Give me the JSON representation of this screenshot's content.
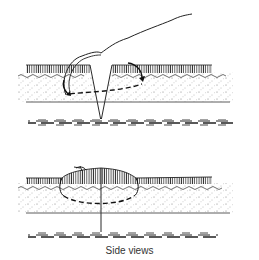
{
  "figure": {
    "caption": "Side views",
    "panels": [
      {
        "id": "top",
        "description": "Wedge-shaped incision through skin layers with suture passing through; curved arrows indicate tissue eversion",
        "elements": [
          "epidermis-layer",
          "dermis-layer",
          "subcutaneous-boundary",
          "muscle-layer",
          "wedge-incision",
          "suture-thread",
          "curved-arrows",
          "dashed-suture-path"
        ]
      },
      {
        "id": "bottom",
        "description": "Closed wound with everted edges forming a raised ridge; dashed path shows buried suture loop",
        "elements": [
          "epidermis-layer",
          "dermis-layer",
          "subcutaneous-boundary",
          "muscle-layer",
          "everted-ridge",
          "suture-knot",
          "dashed-suture-path",
          "vertical-line"
        ]
      }
    ],
    "colors": {
      "ink": "#1a1a1a",
      "background": "#ffffff"
    }
  }
}
